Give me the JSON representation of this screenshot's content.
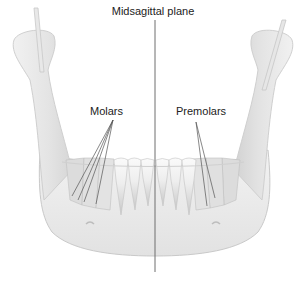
{
  "figure": {
    "title": "Midsagittal plane",
    "labels": {
      "molars": "Molars",
      "premolars": "Premolars"
    },
    "colors": {
      "bone_fill": "#ececec",
      "bone_stroke": "#c4c4c4",
      "teeth_fill": "#f4f4f4",
      "teeth_shadow": "#bdbdbd",
      "midline": "#6e6e6e",
      "leader_lines": "#555555",
      "text": "#222222"
    }
  }
}
